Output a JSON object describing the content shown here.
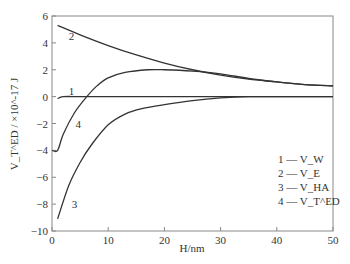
{
  "chart_data": {
    "type": "line",
    "title": "",
    "xlabel": "H/nm",
    "ylabel": "V_T^ED / ×10^-17 J",
    "xlim": [
      0,
      50
    ],
    "ylim": [
      -10,
      6
    ],
    "xticks": [
      0,
      10,
      20,
      30,
      40,
      50
    ],
    "yticks": [
      -10,
      -8,
      -6,
      -4,
      -2,
      0,
      2,
      4,
      6
    ],
    "grid": false,
    "legend_position": "lower right inside",
    "legend": [
      {
        "id": "1",
        "label": "1 — V_W"
      },
      {
        "id": "2",
        "label": "2 — V_E"
      },
      {
        "id": "3",
        "label": "3 — V_HA"
      },
      {
        "id": "4",
        "label": "4 — V_T^ED"
      }
    ],
    "series": [
      {
        "name": "1 — V_W",
        "curve_label": "1",
        "label_at": [
          3,
          0.4
        ],
        "x": [
          1,
          2,
          5,
          10,
          20,
          30,
          40,
          50
        ],
        "y": [
          -0.15,
          0.0,
          0.0,
          0.0,
          0.0,
          0.0,
          0.0,
          0.0
        ]
      },
      {
        "name": "2 — V_E",
        "curve_label": "2",
        "label_at": [
          3,
          4.5
        ],
        "x": [
          1,
          5,
          10,
          15,
          20,
          25,
          30,
          35,
          40,
          45,
          50
        ],
        "y": [
          5.3,
          4.6,
          3.8,
          3.1,
          2.5,
          2.0,
          1.6,
          1.3,
          1.1,
          0.9,
          0.8
        ]
      },
      {
        "name": "3 — V_HA",
        "curve_label": "3",
        "label_at": [
          3.5,
          -8.0
        ],
        "x": [
          1,
          3,
          5,
          7,
          10,
          13,
          16,
          20,
          25,
          30,
          35,
          40,
          50
        ],
        "y": [
          -9.1,
          -6.6,
          -4.9,
          -3.6,
          -2.1,
          -1.3,
          -0.9,
          -0.6,
          -0.3,
          -0.1,
          0.0,
          0.0,
          0.0
        ]
      },
      {
        "name": "4 — V_T^ED",
        "curve_label": "4",
        "label_at": [
          4.2,
          -2.0
        ],
        "x": [
          0,
          1,
          2,
          4,
          6.2,
          8,
          10,
          13,
          17,
          20,
          25,
          30,
          35,
          40,
          45,
          50
        ],
        "y": [
          -4.0,
          -4.0,
          -2.8,
          -1.2,
          0.0,
          0.8,
          1.4,
          1.8,
          2.0,
          2.0,
          1.9,
          1.7,
          1.35,
          1.1,
          0.9,
          0.8
        ]
      }
    ]
  }
}
